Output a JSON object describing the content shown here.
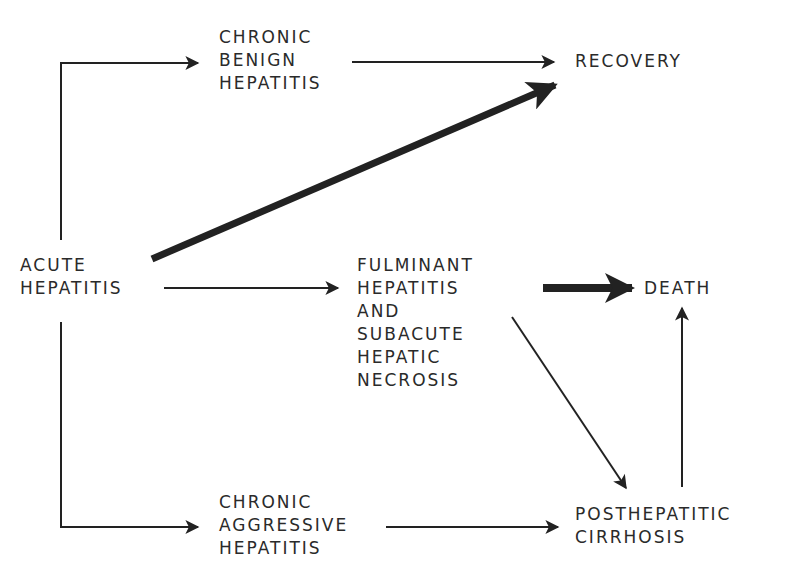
{
  "diagram": {
    "type": "flowchart",
    "nodes": {
      "acute_hepatitis": {
        "lines": [
          "ACUTE",
          "HEPATITIS"
        ]
      },
      "chronic_benign_hepatitis": {
        "lines": [
          "CHRONIC",
          "BENIGN",
          "HEPATITIS"
        ]
      },
      "recovery": {
        "lines": [
          "RECOVERY"
        ]
      },
      "fulminant_hepatitis": {
        "lines": [
          "FULMINANT",
          "HEPATITIS",
          "AND",
          "SUBACUTE",
          "HEPATIC",
          "NECROSIS"
        ]
      },
      "death": {
        "lines": [
          "DEATH"
        ]
      },
      "chronic_aggressive_hepatitis": {
        "lines": [
          "CHRONIC",
          "AGGRESSIVE",
          "HEPATITIS"
        ]
      },
      "posthepatitic_cirrhosis": {
        "lines": [
          "POSTHEPATITIC",
          "CIRRHOSIS"
        ]
      }
    },
    "edges": [
      {
        "from": "ACUTE HEPATITIS",
        "to": "CHRONIC BENIGN HEPATITIS",
        "weight": "thin"
      },
      {
        "from": "CHRONIC BENIGN HEPATITIS",
        "to": "RECOVERY",
        "weight": "thin"
      },
      {
        "from": "ACUTE HEPATITIS",
        "to": "RECOVERY",
        "weight": "thick"
      },
      {
        "from": "ACUTE HEPATITIS",
        "to": "FULMINANT HEPATITIS AND SUBACUTE HEPATIC NECROSIS",
        "weight": "thin"
      },
      {
        "from": "FULMINANT HEPATITIS AND SUBACUTE HEPATIC NECROSIS",
        "to": "DEATH",
        "weight": "thick"
      },
      {
        "from": "FULMINANT HEPATITIS AND SUBACUTE HEPATIC NECROSIS",
        "to": "POSTHEPATITIC CIRRHOSIS",
        "weight": "thin"
      },
      {
        "from": "ACUTE HEPATITIS",
        "to": "CHRONIC AGGRESSIVE HEPATITIS",
        "weight": "thin"
      },
      {
        "from": "CHRONIC AGGRESSIVE HEPATITIS",
        "to": "POSTHEPATITIC CIRRHOSIS",
        "weight": "thin"
      },
      {
        "from": "POSTHEPATITIC CIRRHOSIS",
        "to": "DEATH",
        "weight": "thin"
      }
    ],
    "colors": {
      "ink": "#222222",
      "background": "#ffffff"
    }
  }
}
